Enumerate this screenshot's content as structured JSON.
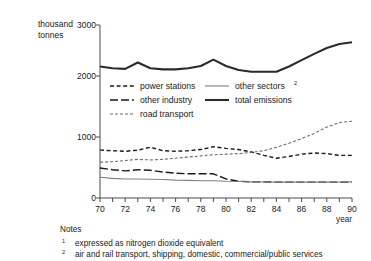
{
  "chart_data": {
    "type": "line",
    "title": "",
    "ylabel": "thousand tonnes",
    "ylabel_line1": "thousand",
    "ylabel_line2": "tonnes",
    "xlabel": "year",
    "ylim": [
      0,
      3000
    ],
    "xlim": [
      70,
      90
    ],
    "ytick_labels": [
      "0",
      "1000",
      "2000",
      "3000"
    ],
    "ytick_values": [
      0,
      1000,
      2000,
      3000
    ],
    "xtick_labels": [
      "70",
      "72",
      "74",
      "76",
      "78",
      "80",
      "82",
      "84",
      "86",
      "88",
      "90"
    ],
    "xtick_values": [
      70,
      72,
      74,
      76,
      78,
      80,
      82,
      84,
      86,
      88,
      90
    ],
    "x": [
      70,
      71,
      72,
      73,
      74,
      75,
      76,
      77,
      78,
      79,
      80,
      81,
      82,
      83,
      84,
      85,
      86,
      87,
      88,
      89,
      90
    ],
    "grid": false,
    "legend_position": "inside-upper-middle",
    "series": [
      {
        "name": "power stations",
        "style": "short-dash",
        "color": "#1a1a1a",
        "values": [
          830,
          820,
          810,
          830,
          880,
          820,
          810,
          820,
          840,
          890,
          860,
          840,
          800,
          740,
          690,
          720,
          760,
          780,
          770,
          740,
          740
        ]
      },
      {
        "name": "other industry",
        "style": "long-dash",
        "color": "#1a1a1a",
        "values": [
          520,
          490,
          470,
          490,
          480,
          450,
          430,
          420,
          420,
          420,
          330,
          290,
          280,
          280,
          275,
          275,
          275,
          275,
          275,
          275,
          275
        ]
      },
      {
        "name": "road transport",
        "style": "fine-dash",
        "color": "#6a6a6a",
        "values": [
          620,
          630,
          650,
          670,
          660,
          670,
          690,
          710,
          730,
          750,
          760,
          770,
          790,
          820,
          880,
          950,
          1030,
          1120,
          1230,
          1310,
          1330
        ]
      },
      {
        "name": "other sectors",
        "style": "thin-solid",
        "color": "#808080",
        "superscript": "2",
        "values": [
          360,
          340,
          330,
          330,
          325,
          320,
          310,
          305,
          300,
          300,
          290,
          285,
          280,
          278,
          276,
          275,
          275,
          275,
          275,
          278,
          280
        ]
      },
      {
        "name": "total emissions",
        "style": "thick-solid",
        "color": "#2b2b2b",
        "values": [
          2280,
          2250,
          2240,
          2350,
          2250,
          2230,
          2230,
          2250,
          2290,
          2400,
          2290,
          2220,
          2190,
          2190,
          2190,
          2280,
          2390,
          2500,
          2600,
          2670,
          2700
        ]
      }
    ],
    "legend": [
      {
        "label": "power stations",
        "style": "short-dash",
        "superscript": ""
      },
      {
        "label": "other sectors",
        "style": "thin-solid",
        "superscript": "2"
      },
      {
        "label": "other industry",
        "style": "long-dash",
        "superscript": ""
      },
      {
        "label": "total emissions",
        "style": "thick-solid",
        "superscript": ""
      },
      {
        "label": "road transport",
        "style": "fine-dash",
        "superscript": ""
      }
    ]
  },
  "notes": {
    "heading": "Notes",
    "items": [
      {
        "marker": "1",
        "text": "expressed as nitrogen dioxide equivalent"
      },
      {
        "marker": "2",
        "text": "air and rail transport, shipping, domestic, commercial/public services"
      }
    ]
  }
}
